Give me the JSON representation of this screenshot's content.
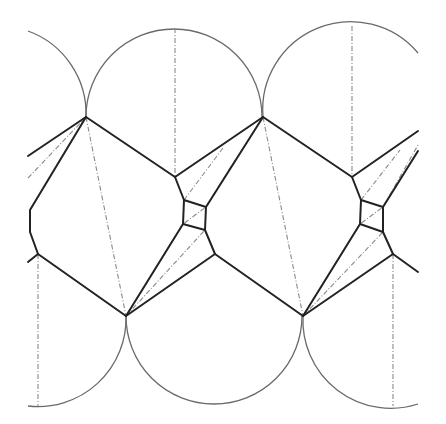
{
  "diagram": {
    "colors": {
      "background": "#ffffff",
      "arc_stroke": "#6a6a6a",
      "edge_stroke": "#222222",
      "dashed_stroke": "#8a8a8a"
    },
    "arcs": [
      {
        "name": "top-arc-left-partial",
        "d": "M 28 31 A 88 88 0 0 1 86 117"
      },
      {
        "name": "top-arc-1",
        "d": "M 86 117 A 88 88 0 0 1 262 117"
      },
      {
        "name": "top-arc-2",
        "d": "M 263 117 A 88 88 0 0 1 418 53"
      },
      {
        "name": "bottom-arc-left",
        "d": "M 28 406 A 88 88 0 0 0 126 316"
      },
      {
        "name": "bottom-arc-1",
        "d": "M 126 316 A 88 88 0 0 0 302 316"
      },
      {
        "name": "bottom-arc-2",
        "d": "M 303 316 A 88 88 0 0 0 418 404"
      }
    ],
    "solid_edges": [
      {
        "name": "left-upper-spoke-a",
        "points": "28,156 86,117"
      },
      {
        "name": "left-upper-spoke-b",
        "points": "86,117 30,210 30,232 38,254 28,262"
      },
      {
        "name": "top1-to-node",
        "points": "86,117 175,177"
      },
      {
        "name": "node-to-top2",
        "points": "175,177 263,117"
      },
      {
        "name": "node-down-1",
        "points": "175,177 184,200"
      },
      {
        "name": "pentagon-1",
        "points": "184,200 206,207 205,230 183,224 184,200"
      },
      {
        "name": "pent1-to-bottom1",
        "points": "183,224 126,316"
      },
      {
        "name": "pent1-to-node-low",
        "points": "205,230 215,254"
      },
      {
        "name": "node-low-to-bottom1",
        "points": "215,254 126,316"
      },
      {
        "name": "node-low-to-bottom2",
        "points": "215,254 303,316"
      },
      {
        "name": "left-low-to-bottom1",
        "points": "38,254 126,316"
      },
      {
        "name": "pent1-to-top2",
        "points": "206,207 263,117"
      },
      {
        "name": "top2-to-node2",
        "points": "263,117 352,177"
      },
      {
        "name": "node2-to-right",
        "points": "352,177 418,131"
      },
      {
        "name": "node2-down",
        "points": "352,177 361,200"
      },
      {
        "name": "pentagon-2",
        "points": "361,200 383,207 383,232 360,224 361,200"
      },
      {
        "name": "pent2-to-bottom2",
        "points": "360,224 303,316"
      },
      {
        "name": "pent2-to-right",
        "points": "383,207 418,151"
      },
      {
        "name": "pent2-to-node-low2",
        "points": "383,232 393,254"
      },
      {
        "name": "node-low2-to-bottom2",
        "points": "393,254 303,316"
      },
      {
        "name": "node-low2-to-right",
        "points": "393,254 418,272"
      }
    ],
    "dashed_lines": [
      {
        "name": "vertical-top1",
        "points": "175,28 175,177"
      },
      {
        "name": "vertical-top2",
        "points": "352,26 352,177"
      },
      {
        "name": "vertical-bottom-left",
        "points": "38,254 38,406"
      },
      {
        "name": "vertical-bottom-right",
        "points": "393,254 393,406"
      },
      {
        "name": "diag-top1-to-bottom1",
        "points": "86,117 126,316"
      },
      {
        "name": "diag-top2-to-bottom2",
        "points": "263,117 303,316"
      },
      {
        "name": "diag-left-spoke",
        "points": "28,178 86,117"
      },
      {
        "name": "diag-pent1",
        "points": "126,316 183,224 206,207 235,160"
      },
      {
        "name": "diag-pent1-upper",
        "points": "184,200 223,148"
      },
      {
        "name": "diag-bottom1-pent1",
        "points": "126,316 205,230"
      },
      {
        "name": "diag-pent2",
        "points": "303,316 360,224 383,207 418,145"
      },
      {
        "name": "diag-bottom2-pent2",
        "points": "303,316 383,232"
      },
      {
        "name": "diag-node2-pent2",
        "points": "361,200 400,150"
      }
    ]
  }
}
